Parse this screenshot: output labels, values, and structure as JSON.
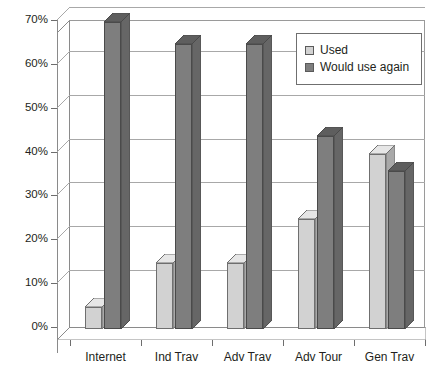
{
  "chart_data": {
    "type": "bar",
    "title": "",
    "xlabel": "",
    "ylabel": "",
    "ylim": [
      0,
      70
    ],
    "ytick_step": 10,
    "grid": true,
    "legend_position": "top-right",
    "style": "3d-clustered-column",
    "categories": [
      "Internet",
      "Ind Trav",
      "Adv Trav",
      "Adv Tour",
      "Gen Trav"
    ],
    "ytick_labels": [
      "0%",
      "10%",
      "20%",
      "30%",
      "40%",
      "50%",
      "60%",
      "70%"
    ],
    "series": [
      {
        "name": "Used",
        "color": "#d2d2d2",
        "values": [
          5,
          15,
          15,
          25,
          40
        ]
      },
      {
        "name": "Would use again",
        "color": "#7e7e7e",
        "values": [
          70,
          65,
          65,
          44,
          36
        ]
      }
    ]
  },
  "legend": {
    "items": [
      {
        "label": "Used",
        "swatch": "used"
      },
      {
        "label": "Would use again",
        "swatch": "again"
      }
    ]
  },
  "colors": {
    "used": "#d2d2d2",
    "would_use_again": "#7e7e7e",
    "grid": "#a8a8a8",
    "axis": "#8a8a8a",
    "text": "#231f20",
    "background": "#ffffff"
  }
}
